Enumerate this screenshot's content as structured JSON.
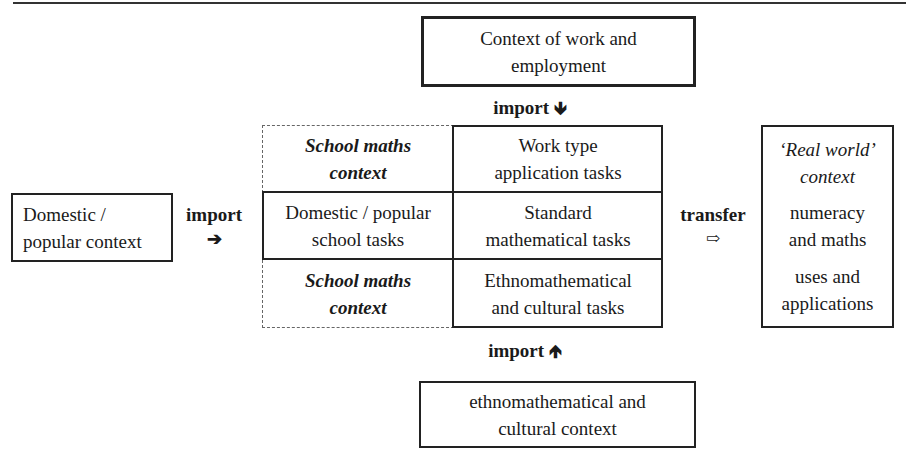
{
  "top_context": {
    "line1": "Context of work and",
    "line2": "employment"
  },
  "import_top": {
    "label": "import",
    "arrow": "🡻"
  },
  "left_context": {
    "line1": "Domestic /",
    "line2": "popular context"
  },
  "import_left": {
    "label": "import",
    "arrow": "➔"
  },
  "grid": {
    "left_col": [
      {
        "line1": "School maths",
        "line2": "context"
      },
      {
        "line1": "Domestic / popular",
        "line2": "school tasks"
      },
      {
        "line1": "School maths",
        "line2": "context"
      }
    ],
    "right_col": [
      {
        "line1": "Work type",
        "line2": "application tasks"
      },
      {
        "line1": "Standard",
        "line2": "mathematical tasks"
      },
      {
        "line1": "Ethnomathematical",
        "line2": "and cultural tasks"
      }
    ]
  },
  "transfer": {
    "label": "transfer",
    "arrow": "⇨"
  },
  "real_world": {
    "title1": "‘Real world’",
    "title2": "context",
    "item1a": "numeracy",
    "item1b": "and maths",
    "item2a": "uses and",
    "item2b": "applications"
  },
  "import_bottom": {
    "label": "import",
    "arrow": "🡹"
  },
  "bottom_context": {
    "line1": "ethnomathematical and",
    "line2": "cultural context"
  }
}
